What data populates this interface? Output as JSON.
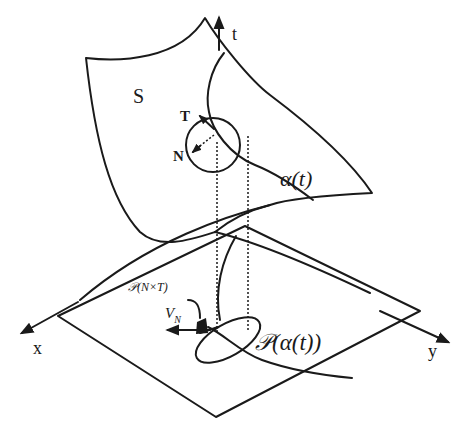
{
  "figure": {
    "colors": {
      "ink": "#1a1a1a",
      "background": "#ffffff"
    },
    "labels": {
      "surface": "S",
      "t_axis": "t",
      "x_axis": "x",
      "y_axis": "y",
      "tangent": "T",
      "normal": "N",
      "curve": "α(t)",
      "projected_curve": "𝒫(α(t))",
      "projected_binormal": "𝒫(N×T)",
      "velocity_normal": "V",
      "velocity_normal_sub": "N"
    }
  }
}
